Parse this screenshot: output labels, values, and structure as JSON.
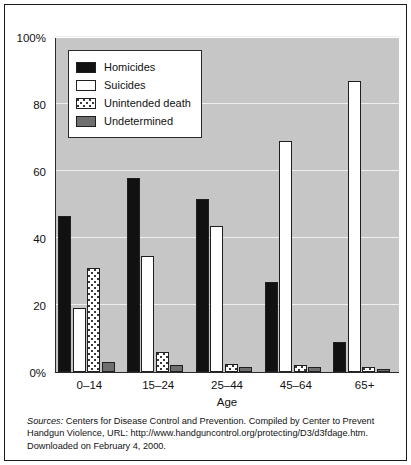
{
  "chart_data": {
    "type": "bar",
    "title": "",
    "xlabel": "Age",
    "ylabel": "",
    "ylim": [
      0,
      100
    ],
    "yticks": [
      0,
      20,
      40,
      60,
      80,
      100
    ],
    "ytick_labels": [
      "0%",
      "20",
      "40",
      "60",
      "80",
      "100%"
    ],
    "grid": true,
    "legend_position": "upper-left inside plot",
    "categories": [
      "0–14",
      "15–24",
      "25–44",
      "45–64",
      "65+"
    ],
    "series": [
      {
        "name": "Homicides",
        "color": "#111111",
        "pattern": "solid",
        "values": [
          46.5,
          58,
          51.5,
          27,
          9
        ]
      },
      {
        "name": "Suicides",
        "color": "#ffffff",
        "pattern": "solid",
        "values": [
          19,
          34.5,
          43.5,
          69,
          87
        ]
      },
      {
        "name": "Unintended death",
        "color": "#ffffff",
        "pattern": "dotted",
        "values": [
          31,
          6,
          2.5,
          2,
          1.5
        ]
      },
      {
        "name": "Undetermined",
        "color": "#6f6f6f",
        "pattern": "solid",
        "values": [
          3,
          2,
          1.5,
          1.5,
          1
        ]
      }
    ]
  },
  "legend": {
    "items": [
      {
        "label": "Homicides"
      },
      {
        "label": "Suicides"
      },
      {
        "label": "Unintended death"
      },
      {
        "label": "Undetermined"
      }
    ]
  },
  "source": {
    "label": "Sources:",
    "line1": " Centers for Disease Control and Prevention. Compiled by Center to Prevent",
    "line2": "Handgun Violence, URL:  http://www.handguncontrol.org/protecting/D3/d3fdage.htm.",
    "line3": "Downloaded on February 4, 2000."
  },
  "colors": {
    "plot_background": "#c6c6c6",
    "gridline": "#eeeeee",
    "axis": "#2b2b2b",
    "homicides": "#111111",
    "suicides": "#ffffff",
    "undetermined": "#6f6f6f"
  }
}
